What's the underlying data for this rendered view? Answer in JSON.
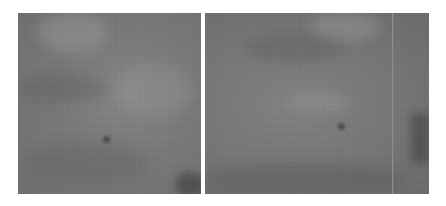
{
  "image": {
    "description": "Two side-by-side grayscale texture panels (mottled gray surface) on white background",
    "background": "#ffffff",
    "panels": [
      {
        "name": "left-panel",
        "x": 18,
        "y": 13,
        "width": 183,
        "height": 181,
        "base_color": "#7e7e7e",
        "features": [
          {
            "type": "light-patch",
            "x": 40,
            "y": 5,
            "w": 60,
            "h": 40
          },
          {
            "type": "light-patch",
            "x": 100,
            "y": 55,
            "w": 80,
            "h": 50
          },
          {
            "type": "dark-spot",
            "x": 88,
            "y": 126,
            "r": 3
          },
          {
            "type": "dark-corner",
            "x": 160,
            "y": 160,
            "w": 25,
            "h": 20
          }
        ]
      },
      {
        "name": "right-panel",
        "x": 205,
        "y": 13,
        "width": 224,
        "height": 181,
        "base_color": "#7c7c7c",
        "seam_x": 188,
        "features": [
          {
            "type": "light-patch",
            "x": 110,
            "y": 0,
            "w": 60,
            "h": 25
          },
          {
            "type": "light-patch",
            "x": 90,
            "y": 80,
            "w": 50,
            "h": 20
          },
          {
            "type": "dark-spot",
            "x": 136,
            "y": 113,
            "r": 3
          },
          {
            "type": "dark-edge",
            "x": 205,
            "y": 100,
            "w": 19,
            "h": 50
          }
        ]
      }
    ]
  }
}
